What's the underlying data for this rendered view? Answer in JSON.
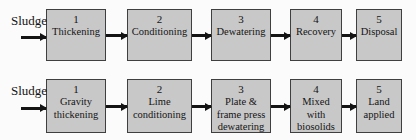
{
  "diagram": {
    "rows": [
      {
        "source_label": "Sludge",
        "steps": [
          {
            "number": "1",
            "label": [
              "Thickening"
            ]
          },
          {
            "number": "2",
            "label": [
              "Conditioning"
            ]
          },
          {
            "number": "3",
            "label": [
              "Dewatering"
            ]
          },
          {
            "number": "4",
            "label": [
              "Recovery"
            ]
          },
          {
            "number": "5",
            "label": [
              "Disposal"
            ]
          }
        ]
      },
      {
        "source_label": "Sludge",
        "steps": [
          {
            "number": "1",
            "label": [
              "Gravity",
              "thickening"
            ]
          },
          {
            "number": "2",
            "label": [
              "Lime",
              "conditioning"
            ]
          },
          {
            "number": "3",
            "label": [
              "Plate &",
              "frame press",
              "dewatering"
            ]
          },
          {
            "number": "4",
            "label": [
              "Mixed",
              "with",
              "biosolids"
            ]
          },
          {
            "number": "5",
            "label": [
              "Land",
              "applied"
            ]
          }
        ]
      }
    ]
  },
  "colors": {
    "background": "#fbfbfb",
    "box_fill": "#c8c8c8",
    "box_border": "#3f3f3f",
    "arrow": "#141414",
    "text": "#141414"
  }
}
